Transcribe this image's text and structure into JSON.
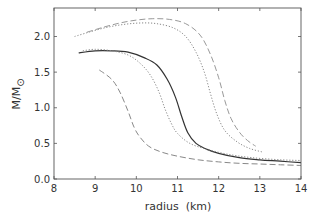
{
  "chart_data": {
    "type": "line",
    "title": "",
    "xlabel": "radius  (km)",
    "ylabel": "M/M",
    "ylabel_subscript": "⊙",
    "xlim": [
      8,
      14
    ],
    "ylim": [
      0.0,
      2.4
    ],
    "xticks": [
      8,
      9,
      10,
      11,
      12,
      13,
      14
    ],
    "xtick_labels": [
      "8",
      "9",
      "10",
      "11",
      "12",
      "13",
      "14"
    ],
    "yticks": [
      0.0,
      0.5,
      1.0,
      1.5,
      2.0
    ],
    "ytick_labels": [
      "0.0",
      "0.5",
      "1.0",
      "1.5",
      "2.0"
    ],
    "grid": false,
    "legend": null,
    "series": [
      {
        "name": "solid",
        "style": "solid",
        "color": "#333333",
        "x": [
          8.6,
          9.0,
          9.4,
          9.8,
          10.2,
          10.5,
          10.75,
          10.95,
          11.1,
          11.25,
          11.45,
          11.7,
          12.0,
          12.5,
          13.0,
          13.5,
          14.0
        ],
        "y": [
          1.77,
          1.8,
          1.8,
          1.78,
          1.7,
          1.6,
          1.4,
          1.15,
          0.88,
          0.65,
          0.5,
          0.42,
          0.36,
          0.3,
          0.27,
          0.25,
          0.23
        ]
      },
      {
        "name": "dotted-inner",
        "style": "dotted",
        "color": "#888888",
        "x": [
          8.7,
          9.0,
          9.4,
          9.8,
          10.1,
          10.35,
          10.55,
          10.7,
          10.85,
          11.0,
          11.3,
          11.7,
          12.2,
          12.8,
          13.5,
          14.0
        ],
        "y": [
          1.8,
          1.82,
          1.8,
          1.74,
          1.62,
          1.45,
          1.22,
          0.98,
          0.78,
          0.64,
          0.5,
          0.42,
          0.35,
          0.3,
          0.27,
          0.26
        ]
      },
      {
        "name": "dashed-inner",
        "style": "dashed",
        "color": "#888888",
        "x": [
          9.1,
          9.4,
          9.6,
          9.8,
          9.95,
          10.1,
          10.3,
          10.6,
          11.0,
          11.5,
          12.0,
          12.5,
          13.0,
          13.5,
          14.0
        ],
        "y": [
          1.53,
          1.4,
          1.22,
          0.95,
          0.72,
          0.58,
          0.46,
          0.38,
          0.32,
          0.27,
          0.24,
          0.22,
          0.21,
          0.2,
          0.19
        ]
      },
      {
        "name": "dotted-outer",
        "style": "dotted",
        "color": "#888888",
        "x": [
          8.5,
          8.9,
          9.3,
          9.7,
          10.1,
          10.5,
          10.9,
          11.2,
          11.45,
          11.65,
          11.8,
          11.95,
          12.15,
          12.45,
          12.75,
          13.05
        ],
        "y": [
          2.0,
          2.07,
          2.13,
          2.17,
          2.19,
          2.18,
          2.12,
          2.0,
          1.78,
          1.5,
          1.2,
          0.92,
          0.68,
          0.52,
          0.43,
          0.38
        ]
      },
      {
        "name": "dashed-outer",
        "style": "dashed",
        "color": "#999999",
        "x": [
          8.8,
          9.2,
          9.6,
          10.0,
          10.4,
          10.8,
          11.2,
          11.55,
          11.8,
          12.0,
          12.15,
          12.3,
          12.5,
          12.7,
          12.9
        ],
        "y": [
          2.06,
          2.13,
          2.19,
          2.23,
          2.25,
          2.24,
          2.18,
          2.02,
          1.75,
          1.42,
          1.1,
          0.85,
          0.66,
          0.54,
          0.46
        ]
      }
    ]
  }
}
